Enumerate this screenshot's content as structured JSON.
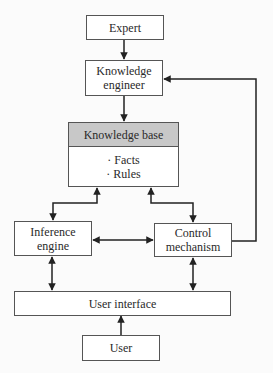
{
  "diagram": {
    "type": "flowchart",
    "nodes": {
      "expert": {
        "label": "Expert"
      },
      "knowledge_engineer": {
        "line1": "Knowledge",
        "line2": "engineer"
      },
      "knowledge_base": {
        "title": "Knowledge base",
        "items": [
          "· Facts",
          "· Rules"
        ]
      },
      "inference_engine": {
        "line1": "Inference",
        "line2": "engine"
      },
      "control_mechanism": {
        "line1": "Control",
        "line2": "mechanism"
      },
      "user_interface": {
        "label": "User interface"
      },
      "user": {
        "label": "User"
      }
    },
    "edges": [
      {
        "from": "Expert",
        "to": "Knowledge engineer",
        "direction": "one-way"
      },
      {
        "from": "Knowledge engineer",
        "to": "Knowledge base",
        "direction": "one-way"
      },
      {
        "from": "Knowledge base",
        "to": "Inference engine",
        "direction": "two-way"
      },
      {
        "from": "Knowledge base",
        "to": "Control mechanism",
        "direction": "two-way"
      },
      {
        "from": "Inference engine",
        "to": "Control mechanism",
        "direction": "two-way"
      },
      {
        "from": "Inference engine",
        "to": "User interface",
        "direction": "two-way"
      },
      {
        "from": "Control mechanism",
        "to": "User interface",
        "direction": "two-way"
      },
      {
        "from": "User",
        "to": "User interface",
        "direction": "one-way"
      },
      {
        "from": "Control mechanism",
        "to": "Knowledge engineer",
        "direction": "one-way"
      }
    ],
    "colors": {
      "header_fill": "#c8c8c8",
      "line": "#222222",
      "box_border": "#555555"
    }
  }
}
